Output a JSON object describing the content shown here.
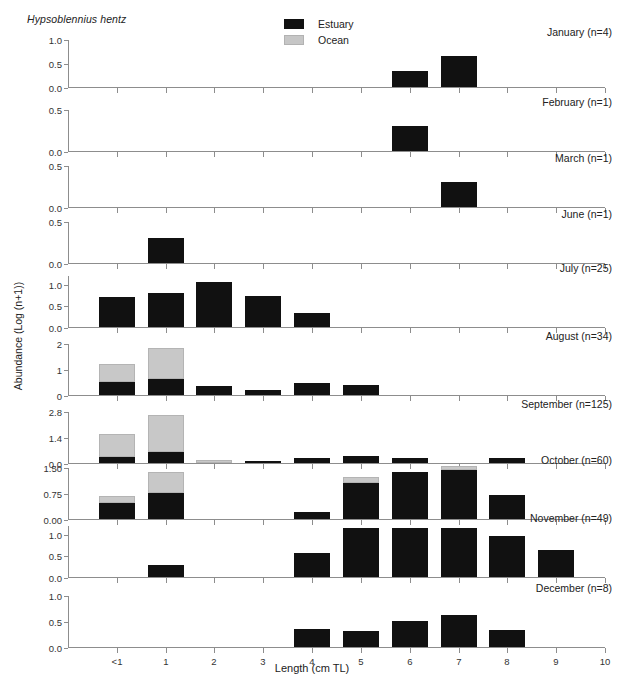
{
  "figure": {
    "species": "Hypsoblennius hentz",
    "xlabel": "Length (cm TL)",
    "ylabel": "Abundance (Log (n+1))"
  },
  "legend": {
    "position": "top-center",
    "items": [
      {
        "label": "Estuary",
        "key": "estuary",
        "color": "#111111"
      },
      {
        "label": "Ocean",
        "key": "ocean",
        "color": "#c8c8c8"
      }
    ]
  },
  "chart_data": {
    "type": "bar",
    "title": "Hypsoblennius hentz",
    "xlabel": "Length (cm TL)",
    "ylabel": "Abundance (Log (n+1))",
    "grid": false,
    "stacked": true,
    "legend_position": "top-center",
    "categories": [
      "<1",
      "1",
      "2",
      "3",
      "4",
      "5",
      "6",
      "7",
      "8",
      "9",
      "10"
    ],
    "xlim": [
      0,
      10
    ],
    "panels": [
      {
        "label": "January (n=4)",
        "month": "January",
        "n": 4,
        "ylim": [
          0,
          1.0
        ],
        "yticks": [
          0.0,
          0.5,
          1.0
        ],
        "ytick_labels": [
          "0.0",
          "0.5",
          "1.0"
        ],
        "series": [
          {
            "name": "Estuary",
            "values": [
              0,
              0,
              0,
              0,
              0,
              0,
              0.33,
              0.65,
              0,
              0,
              0
            ]
          },
          {
            "name": "Ocean",
            "values": [
              0,
              0,
              0,
              0,
              0,
              0,
              0,
              0,
              0,
              0,
              0
            ]
          }
        ]
      },
      {
        "label": "February (n=1)",
        "month": "February",
        "n": 1,
        "ylim": [
          0,
          0.5
        ],
        "yticks": [
          0.0,
          0.5
        ],
        "ytick_labels": [
          "0.0",
          "0.5"
        ],
        "series": [
          {
            "name": "Estuary",
            "values": [
              0,
              0,
              0,
              0,
              0,
              0,
              0.3,
              0,
              0,
              0,
              0
            ]
          },
          {
            "name": "Ocean",
            "values": [
              0,
              0,
              0,
              0,
              0,
              0,
              0,
              0,
              0,
              0,
              0
            ]
          }
        ]
      },
      {
        "label": "March (n=1)",
        "month": "March",
        "n": 1,
        "ylim": [
          0,
          0.5
        ],
        "yticks": [
          0.0,
          0.5
        ],
        "ytick_labels": [
          "0.0",
          "0.5"
        ],
        "series": [
          {
            "name": "Estuary",
            "values": [
              0,
              0,
              0,
              0,
              0,
              0,
              0,
              0.3,
              0,
              0,
              0
            ]
          },
          {
            "name": "Ocean",
            "values": [
              0,
              0,
              0,
              0,
              0,
              0,
              0,
              0,
              0,
              0,
              0
            ]
          }
        ]
      },
      {
        "label": "June (n=1)",
        "month": "June",
        "n": 1,
        "ylim": [
          0,
          0.5
        ],
        "yticks": [
          0.0,
          0.5
        ],
        "ytick_labels": [
          "0.0",
          "0.5"
        ],
        "series": [
          {
            "name": "Estuary",
            "values": [
              0,
              0.3,
              0,
              0,
              0,
              0,
              0,
              0,
              0,
              0,
              0
            ]
          },
          {
            "name": "Ocean",
            "values": [
              0,
              0,
              0,
              0,
              0,
              0,
              0,
              0,
              0,
              0,
              0
            ]
          }
        ]
      },
      {
        "label": "July (n=25)",
        "month": "July",
        "n": 25,
        "ylim": [
          0,
          1.2
        ],
        "yticks": [
          0.0,
          0.5,
          1.0
        ],
        "ytick_labels": [
          "0.0",
          "0.5",
          "1.0"
        ],
        "series": [
          {
            "name": "Estuary",
            "values": [
              0.7,
              0.78,
              1.04,
              0.72,
              0.32,
              0,
              0,
              0,
              0,
              0,
              0
            ]
          },
          {
            "name": "Ocean",
            "values": [
              0,
              0,
              0,
              0,
              0,
              0,
              0,
              0,
              0,
              0,
              0
            ]
          }
        ]
      },
      {
        "label": "August (n=34)",
        "month": "August",
        "n": 34,
        "ylim": [
          0,
          2.0
        ],
        "yticks": [
          0,
          1,
          2
        ],
        "ytick_labels": [
          "0",
          "1",
          "2"
        ],
        "series": [
          {
            "name": "Estuary",
            "values": [
              0.5,
              0.62,
              0.33,
              0.18,
              0.45,
              0.4,
              0,
              0,
              0,
              0,
              0
            ]
          },
          {
            "name": "Ocean",
            "values": [
              0.68,
              1.18,
              0,
              0,
              0,
              0,
              0,
              0,
              0,
              0,
              0
            ]
          }
        ]
      },
      {
        "label": "September (n=125)",
        "month": "September",
        "n": 125,
        "ylim": [
          0,
          2.8
        ],
        "yticks": [
          0.0,
          1.4,
          2.8
        ],
        "ytick_labels": [
          "0.0",
          "1.4",
          "2.8"
        ],
        "series": [
          {
            "name": "Estuary",
            "values": [
              0.3,
              0.6,
              0,
              0.12,
              0.28,
              0.38,
              0.25,
              0,
              0.25,
              0,
              0
            ]
          },
          {
            "name": "Ocean",
            "values": [
              1.25,
              2.0,
              0.15,
              0,
              0,
              0,
              0,
              0,
              0,
              0,
              0
            ]
          }
        ]
      },
      {
        "label": "October (n=60)",
        "month": "October",
        "n": 60,
        "ylim": [
          0,
          1.5
        ],
        "yticks": [
          0.0,
          0.75,
          1.5
        ],
        "ytick_labels": [
          "0.00",
          "0.75",
          "1.50"
        ],
        "series": [
          {
            "name": "Estuary",
            "values": [
              0.45,
              0.75,
              0,
              0,
              0.2,
              1.05,
              1.35,
              1.4,
              0.7,
              0,
              0
            ]
          },
          {
            "name": "Ocean",
            "values": [
              0.2,
              0.6,
              0,
              0,
              0,
              0.15,
              0,
              0.12,
              0,
              0,
              0
            ]
          }
        ]
      },
      {
        "label": "November (n=49)",
        "month": "November",
        "n": 49,
        "ylim": [
          0,
          1.2
        ],
        "yticks": [
          0.0,
          0.5,
          1.0
        ],
        "ytick_labels": [
          "0.0",
          "0.5",
          "1.0"
        ],
        "series": [
          {
            "name": "Estuary",
            "values": [
              0,
              0.28,
              0,
              0,
              0.55,
              1.12,
              1.12,
              1.12,
              0.95,
              0.62,
              0
            ]
          },
          {
            "name": "Ocean",
            "values": [
              0,
              0,
              0,
              0,
              0,
              0,
              0,
              0,
              0,
              0,
              0
            ]
          }
        ]
      },
      {
        "label": "December (n=8)",
        "month": "December",
        "n": 8,
        "ylim": [
          0,
          1.0
        ],
        "yticks": [
          0.0,
          0.5,
          1.0
        ],
        "ytick_labels": [
          "0.0",
          "0.5",
          "1.0"
        ],
        "series": [
          {
            "name": "Estuary",
            "values": [
              0,
              0,
              0,
              0,
              0.35,
              0.31,
              0.5,
              0.62,
              0.33,
              0,
              0
            ]
          },
          {
            "name": "Ocean",
            "values": [
              0,
              0,
              0,
              0,
              0,
              0,
              0,
              0,
              0,
              0,
              0
            ]
          }
        ]
      }
    ]
  }
}
